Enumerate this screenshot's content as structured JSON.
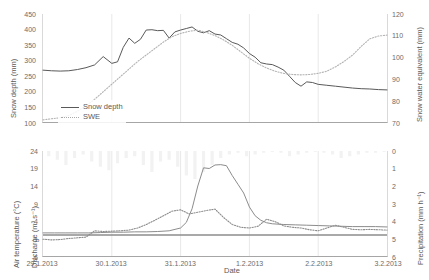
{
  "figure": {
    "xlabel": "Date",
    "xticks": [
      "29.1.2013",
      "30.1.2013",
      "31.1.2013",
      "1.2.2013",
      "2.2.2013",
      "3.2.2013"
    ]
  },
  "panels": {
    "top": {
      "left_axis_title": "Snow depth (mm)",
      "right_axis_title": "Snow water equivalent (mm)",
      "left_ticks": [
        "450",
        "400",
        "350",
        "300",
        "250",
        "200",
        "150",
        "100"
      ],
      "right_ticks": [
        "120",
        "110",
        "100",
        "90",
        "80",
        "70"
      ],
      "legend": [
        {
          "label": "Snow depth",
          "style": "solid",
          "color": "#595959"
        },
        {
          "label": "SWE",
          "style": "dotted",
          "color": "#b3b3b3"
        }
      ]
    },
    "bottom": {
      "left_axis_title_line1": "Air temperature (°C)",
      "left_axis_title_line2": "Discharge (m³ s⁻¹)",
      "right_axis_title": "Precipitation (mm h⁻¹)",
      "left_ticks": [
        "24",
        "19",
        "14",
        "9",
        "4",
        "-1",
        "-6"
      ],
      "right_ticks": [
        "0",
        "1",
        "2",
        "3",
        "4",
        "5",
        "6"
      ],
      "legend": [
        {
          "label": "Precipitation",
          "style": "bar",
          "color": "#f2f2f2"
        },
        {
          "label": "Discharge",
          "style": "solid",
          "color": "#8c8c8c"
        },
        {
          "label": "Air temperature",
          "style": "dashdot",
          "color": "#8c8c8c"
        }
      ]
    }
  },
  "chart_data": [
    {
      "type": "line",
      "id": "snow-panel",
      "title": "",
      "xlabel": "Date",
      "x_range": [
        "29.1.2013",
        "3.2.2013"
      ],
      "xticks": [
        "29.1.2013",
        "30.1.2013",
        "31.1.2013",
        "1.2.2013",
        "2.2.2013",
        "3.2.2013"
      ],
      "grid": false,
      "legend_position": "lower-left",
      "axes": [
        {
          "side": "left",
          "label": "Snow depth (mm)",
          "ylim": [
            100,
            450
          ],
          "ytick_step": 50
        },
        {
          "side": "right",
          "label": "Snow water equivalent (mm)",
          "ylim": [
            70,
            120
          ],
          "ytick_step": 10
        }
      ],
      "series": [
        {
          "name": "Snow depth",
          "axis": "left",
          "unit": "mm",
          "style": "solid",
          "color": "#595959",
          "x_hours": [
            0,
            3,
            6,
            9,
            12,
            15,
            18,
            21,
            24,
            26,
            28,
            30,
            32,
            34,
            36,
            38,
            40,
            42,
            44,
            46,
            48,
            50,
            52,
            54,
            56,
            58,
            60,
            62,
            64,
            66,
            68,
            70,
            72,
            74,
            76,
            78,
            80,
            82,
            84,
            86,
            88,
            90,
            92,
            94,
            96,
            99,
            102,
            105,
            108,
            111,
            114,
            117,
            120
          ],
          "values": [
            268,
            266,
            265,
            266,
            270,
            276,
            285,
            312,
            290,
            295,
            342,
            372,
            355,
            368,
            398,
            399,
            396,
            397,
            372,
            392,
            398,
            403,
            408,
            394,
            389,
            396,
            385,
            382,
            370,
            358,
            352,
            340,
            322,
            310,
            292,
            288,
            286,
            278,
            268,
            248,
            228,
            216,
            230,
            228,
            222,
            219,
            216,
            213,
            210,
            208,
            207,
            205,
            204
          ]
        },
        {
          "name": "SWE",
          "axis": "right",
          "unit": "mm",
          "style": "dotted",
          "color": "#b3b3b3",
          "x_hours": [
            0,
            3,
            6,
            9,
            12,
            15,
            18,
            21,
            24,
            27,
            30,
            33,
            36,
            39,
            42,
            45,
            48,
            51,
            54,
            57,
            60,
            63,
            66,
            69,
            72,
            75,
            78,
            81,
            84,
            87,
            90,
            93,
            96,
            99,
            102,
            105,
            108,
            111,
            114,
            117,
            120
          ],
          "values": [
            71,
            71.5,
            72,
            73,
            75,
            77.5,
            80.5,
            84,
            87.5,
            91,
            94.5,
            98,
            101,
            104,
            107,
            109.5,
            111,
            112,
            112.5,
            111.5,
            110,
            108,
            105.5,
            102.5,
            99.5,
            97,
            95,
            93.5,
            92.5,
            92,
            91.8,
            92,
            92.5,
            93.5,
            95.5,
            98,
            101,
            105,
            108.5,
            109.8,
            110.2
          ]
        }
      ]
    },
    {
      "type": "line",
      "id": "hydro-panel",
      "title": "",
      "xlabel": "Date",
      "x_range": [
        "29.1.2013",
        "3.2.2013"
      ],
      "xticks": [
        "29.1.2013",
        "30.1.2013",
        "31.1.2013",
        "1.2.2013",
        "2.2.2013",
        "3.2.2013"
      ],
      "grid": false,
      "legend_position": "center-left",
      "axes": [
        {
          "side": "left",
          "label": "Air temperature (°C) / Discharge (m³ s⁻¹)",
          "ylim": [
            -6,
            24
          ],
          "ytick_step": 5
        },
        {
          "side": "right",
          "label": "Precipitation (mm h⁻¹)",
          "ylim": [
            0,
            6
          ],
          "ytick_step": 1,
          "inverted": true
        }
      ],
      "series": [
        {
          "name": "Discharge",
          "axis": "left",
          "unit": "m3 s-1",
          "style": "solid",
          "color": "#8c8c8c",
          "x_hours": [
            0,
            4,
            8,
            12,
            16,
            20,
            24,
            28,
            32,
            36,
            40,
            44,
            48,
            50,
            52,
            54,
            56,
            58,
            60,
            62,
            64,
            66,
            68,
            70,
            72,
            74,
            76,
            78,
            80,
            84,
            88,
            92,
            96,
            100,
            104,
            108,
            112,
            116,
            120
          ],
          "values": [
            0.6,
            0.6,
            0.6,
            0.6,
            0.6,
            0.7,
            0.8,
            0.8,
            0.9,
            0.9,
            1.0,
            1.2,
            2.0,
            3.6,
            7.5,
            14.0,
            19.2,
            19.0,
            20.0,
            20.1,
            19.8,
            17.0,
            14.5,
            12.0,
            8.0,
            5.5,
            4.2,
            3.5,
            3.2,
            3.0,
            2.9,
            2.8,
            2.7,
            2.6,
            2.5,
            2.4,
            2.4,
            2.4,
            2.3
          ]
        },
        {
          "name": "Air temperature",
          "axis": "left",
          "unit": "degC",
          "style": "dotted",
          "color": "#8c8c8c",
          "x_hours": [
            0,
            3,
            6,
            9,
            12,
            15,
            18,
            21,
            24,
            27,
            30,
            33,
            36,
            39,
            42,
            45,
            48,
            51,
            54,
            57,
            60,
            63,
            66,
            69,
            72,
            75,
            78,
            81,
            84,
            87,
            90,
            93,
            96,
            99,
            102,
            105,
            108,
            111,
            114,
            117,
            120
          ],
          "values": [
            -1.2,
            -1.4,
            -1.3,
            -1.0,
            -0.8,
            -0.6,
            1.2,
            1.0,
            1.1,
            1.2,
            1.4,
            2.0,
            3.0,
            4.2,
            5.5,
            6.8,
            7.2,
            6.0,
            6.5,
            7.0,
            7.4,
            5.0,
            3.0,
            2.2,
            2.0,
            2.5,
            4.5,
            3.8,
            2.6,
            2.2,
            2.0,
            1.5,
            1.2,
            2.0,
            2.8,
            2.2,
            1.6,
            1.5,
            1.6,
            1.5,
            1.4
          ]
        },
        {
          "name": "Precipitation",
          "axis": "right",
          "unit": "mm h-1",
          "style": "bar",
          "color": "#f2f2f2",
          "x_hours": [
            2,
            5,
            8,
            11,
            14,
            17,
            20,
            23,
            26,
            29,
            32,
            35,
            38,
            41,
            44,
            47,
            50,
            53,
            56,
            59,
            62,
            65,
            68,
            71,
            74,
            77,
            80,
            83,
            86,
            89,
            92,
            95,
            98,
            101,
            104,
            107,
            110,
            113,
            116,
            119
          ],
          "values": [
            0.3,
            0.5,
            0.8,
            0.4,
            0.2,
            0.6,
            0.9,
            1.1,
            0.7,
            0.4,
            0.3,
            0.8,
            1.2,
            0.6,
            0.5,
            0.9,
            1.4,
            1.6,
            1.2,
            0.8,
            0.4,
            0.2,
            0.1,
            0.3,
            0.2,
            0.1,
            0.05,
            0.1,
            0.3,
            0.2,
            0.1,
            0.05,
            0.1,
            0.2,
            0.4,
            0.3,
            0.2,
            0.1,
            0.1,
            0.05
          ]
        }
      ]
    }
  ]
}
